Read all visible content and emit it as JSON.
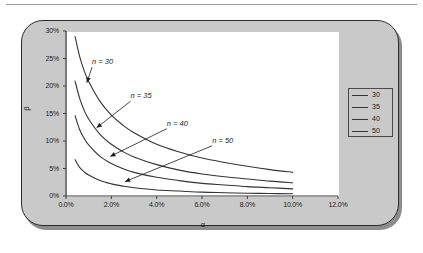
{
  "figure": {
    "panel_bg": "#c9c9c9",
    "plot_bg": "#ffffff",
    "border_color": "#2b2b2b"
  },
  "chart_data": {
    "type": "line",
    "title": "",
    "xlabel": "α",
    "ylabel": "β",
    "xlim": [
      0,
      12
    ],
    "ylim": [
      0,
      30
    ],
    "x_ticks": [
      "0.0%",
      "2.0%",
      "4.0%",
      "6.0%",
      "8.0%",
      "10.0%",
      "12.0%"
    ],
    "x_tick_values": [
      0,
      2,
      4,
      6,
      8,
      10,
      12
    ],
    "y_ticks": [
      "0%",
      "5%",
      "10%",
      "15%",
      "20%",
      "25%",
      "30%"
    ],
    "y_tick_values": [
      0,
      5,
      10,
      15,
      20,
      25,
      30
    ],
    "grid": false,
    "legend_position": "right",
    "legend_entries": [
      "30",
      "35",
      "40",
      "50"
    ],
    "x": [
      0.4,
      0.6,
      0.8,
      1.0,
      1.5,
      2.0,
      2.5,
      3.0,
      4.0,
      5.0,
      6.0,
      7.0,
      8.0,
      9.0,
      10.0
    ],
    "series": [
      {
        "name": "30",
        "values": [
          29.0,
          25.4,
          22.8,
          20.8,
          17.2,
          14.7,
          12.9,
          11.5,
          9.4,
          8.0,
          6.9,
          6.1,
          5.4,
          4.8,
          4.3
        ]
      },
      {
        "name": "35",
        "values": [
          20.9,
          17.8,
          15.6,
          14.0,
          11.2,
          9.4,
          8.1,
          7.1,
          5.7,
          4.7,
          4.0,
          3.5,
          3.1,
          2.7,
          2.4
        ]
      },
      {
        "name": "40",
        "values": [
          14.6,
          12.1,
          10.5,
          9.3,
          7.2,
          5.9,
          5.0,
          4.3,
          3.4,
          2.8,
          2.3,
          2.0,
          1.7,
          1.5,
          1.3
        ]
      },
      {
        "name": "50",
        "values": [
          6.6,
          5.2,
          4.4,
          3.8,
          2.8,
          2.2,
          1.8,
          1.5,
          1.1,
          0.9,
          0.7,
          0.6,
          0.5,
          0.45,
          0.4
        ]
      }
    ],
    "annotations": [
      {
        "text": "n = 30",
        "label_x": 1.15,
        "label_y": 23.8,
        "point_x": 0.92,
        "point_y": 20.6
      },
      {
        "text": "n = 35",
        "label_x": 2.85,
        "label_y": 17.6,
        "point_x": 1.35,
        "point_y": 12.4
      },
      {
        "text": "n = 40",
        "label_x": 4.45,
        "label_y": 12.6,
        "point_x": 1.95,
        "point_y": 7.2
      },
      {
        "text": "n = 50",
        "label_x": 6.45,
        "label_y": 9.5,
        "point_x": 2.6,
        "point_y": 2.6
      }
    ]
  }
}
